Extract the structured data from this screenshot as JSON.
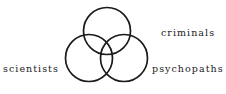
{
  "diagram": {
    "type": "venn",
    "set_count": 3,
    "stroke_color": "#1b1b1b",
    "fill_color": "none",
    "background_color": "#ffffff",
    "circles": [
      {
        "name": "top-circle",
        "cx": 107,
        "cy": 31,
        "r": 23.5
      },
      {
        "name": "left-circle",
        "cx": 89,
        "cy": 58,
        "r": 23.5
      },
      {
        "name": "right-circle",
        "cx": 124,
        "cy": 58,
        "r": 23.5
      }
    ],
    "labels": {
      "left": "scientists",
      "top_right": "criminals",
      "bottom_right": "psychopaths"
    }
  }
}
